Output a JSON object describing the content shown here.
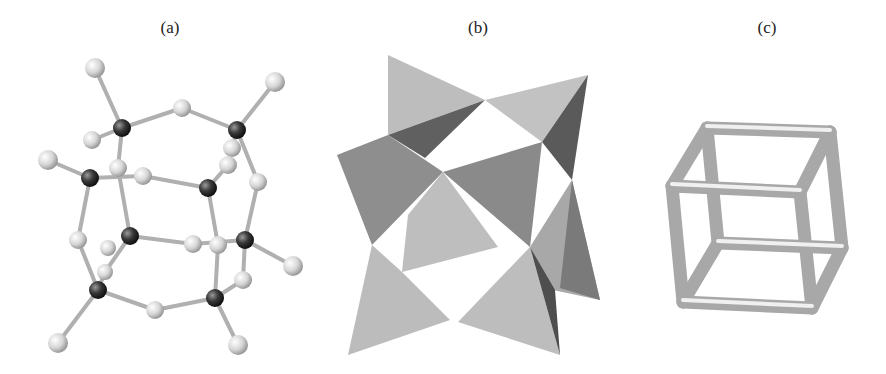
{
  "figure": {
    "panels": [
      {
        "label": "(a)",
        "content": "ball-and-stick cage structure with dark and light atoms"
      },
      {
        "label": "(b)",
        "content": "corner-sharing tetrahedra polyhedral model"
      },
      {
        "label": "(c)",
        "content": "cube wireframe with rounded tube edges"
      }
    ]
  },
  "colors": {
    "background": "#ffffff",
    "dark_atom": "#3a3a3a",
    "light_atom": "#d8d8d8",
    "bond": "#bdbdbd",
    "tetra_light": "#bcbcbc",
    "tetra_mid": "#8f8f8f",
    "tetra_dark": "#555555",
    "tube": "#b8b8b8"
  }
}
